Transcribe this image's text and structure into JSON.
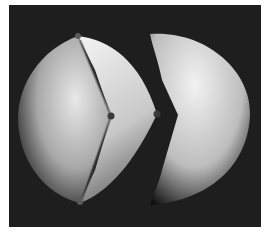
{
  "image": {
    "description": "Grayscale 3D render of a sphere split into a left wedge piece and a right piece with a V-shaped notch",
    "background_color": "#1e1e1e",
    "page_color": "#ffffff",
    "frame": {
      "x": 9,
      "y": 5,
      "width": 252,
      "height": 222
    }
  },
  "shapes": {
    "left_piece": {
      "highlight": "#e8e8e8",
      "mid": "#a8a8a8",
      "shadow": "#1a1a1a"
    },
    "left_wedge_face": {
      "highlight": "#f0f0f0",
      "mid": "#c8c8c8",
      "shadow": "#6a6a6a"
    },
    "right_piece": {
      "highlight": "#f2f2f2",
      "mid": "#bdbdbd",
      "shadow": "#101010"
    }
  },
  "markers": [
    {
      "name": "top-vertex",
      "x": 78,
      "y": 36,
      "r": 3,
      "color": "#5a5a5a"
    },
    {
      "name": "crease-vertex",
      "x": 111,
      "y": 116,
      "r": 3.5,
      "color": "#3a3a3a"
    },
    {
      "name": "edge-vertex",
      "x": 157,
      "y": 114,
      "r": 3.5,
      "color": "#3a3a3a"
    },
    {
      "name": "bottom-vertex",
      "x": 80,
      "y": 202,
      "r": 3,
      "color": "#5a5a5a"
    }
  ]
}
